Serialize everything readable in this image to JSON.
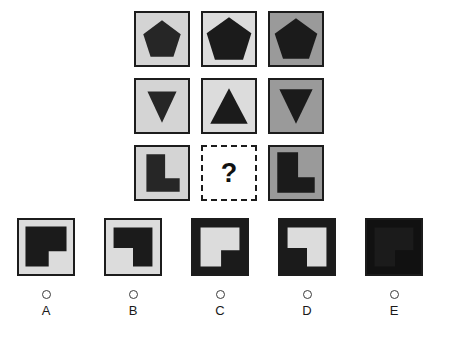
{
  "puzzle": {
    "type": "matrix-reasoning",
    "question_mark": "?",
    "colors": {
      "light_gray": "#d4d4d4",
      "very_light_gray": "#dcdcdc",
      "mid_gray": "#9a9a9a",
      "dark_shape": "#262626",
      "near_black": "#1b1b1b",
      "frame": "#1c1c1c",
      "white": "#ffffff",
      "page_background": "#ffffff"
    },
    "matrix": {
      "rows": 3,
      "cols": 3,
      "cells": [
        {
          "position": "r1c1",
          "shape": "pentagon",
          "rotation": 0,
          "background": "#d4d4d4",
          "shape_color": "#262626",
          "state": "filled"
        },
        {
          "position": "r1c2",
          "shape": "pentagon",
          "rotation": 0,
          "background": "#dcdcdc",
          "shape_color": "#1b1b1b",
          "state": "filled"
        },
        {
          "position": "r1c3",
          "shape": "pentagon",
          "rotation": 0,
          "background": "#9a9a9a",
          "shape_color": "#1b1b1b",
          "state": "filled"
        },
        {
          "position": "r2c1",
          "shape": "triangle-down",
          "rotation": 180,
          "background": "#d4d4d4",
          "shape_color": "#262626",
          "state": "filled"
        },
        {
          "position": "r2c2",
          "shape": "triangle-up",
          "rotation": 0,
          "background": "#dcdcdc",
          "shape_color": "#1b1b1b",
          "state": "filled"
        },
        {
          "position": "r2c3",
          "shape": "triangle-down",
          "rotation": 180,
          "background": "#9a9a9a",
          "shape_color": "#1b1b1b",
          "state": "filled"
        },
        {
          "position": "r3c1",
          "shape": "l-shape",
          "rotation": 0,
          "background": "#d4d4d4",
          "shape_color": "#262626",
          "state": "filled"
        },
        {
          "position": "r3c2",
          "shape": "question-mark",
          "rotation": 0,
          "background": "#ffffff",
          "shape_color": "#111111",
          "state": "missing"
        },
        {
          "position": "r3c3",
          "shape": "l-shape",
          "rotation": 0,
          "background": "#9a9a9a",
          "shape_color": "#1b1b1b",
          "state": "filled"
        }
      ]
    },
    "options": [
      {
        "id": "A",
        "label": "A",
        "shape": "l-shape",
        "rotation": 180,
        "background": "#dcdcdc",
        "shape_color": "#1b1b1b",
        "inverted": false,
        "selected": false
      },
      {
        "id": "B",
        "label": "B",
        "shape": "l-shape",
        "rotation": 90,
        "background": "#dcdcdc",
        "shape_color": "#1b1b1b",
        "inverted": false,
        "selected": false
      },
      {
        "id": "C",
        "label": "C",
        "shape": "l-shape",
        "rotation": 180,
        "background": "#1b1b1b",
        "shape_color": "#dcdcdc",
        "inverted": true,
        "selected": false
      },
      {
        "id": "D",
        "label": "D",
        "shape": "l-shape",
        "rotation": 90,
        "background": "#1b1b1b",
        "shape_color": "#dcdcdc",
        "inverted": true,
        "selected": false
      },
      {
        "id": "E",
        "label": "E",
        "shape": "l-shape",
        "rotation": 180,
        "background": "#111111",
        "shape_color": "#1b1b1b",
        "inverted": true,
        "selected": false
      }
    ]
  }
}
